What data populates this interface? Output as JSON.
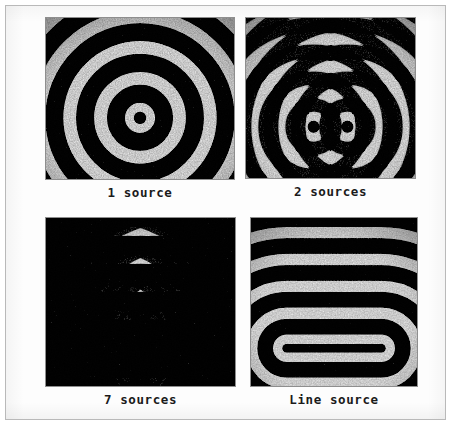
{
  "figure": {
    "kind": "ripple-tank-wave-pattern-figure",
    "background_color": "#ffffff",
    "frame_color": "#b9b9b9",
    "wave_crest_color": "#f2f2f2",
    "wave_trough_color": "#080808",
    "caption_color": "#1b1b1b",
    "panels": [
      {
        "id": "1-source",
        "caption": "1 source",
        "pattern": "concentric-circles",
        "source_count": 1,
        "sources": [
          {
            "x": 0.5,
            "y": 0.62
          }
        ],
        "wavelength": 0.082,
        "description": "Circular wavefronts radiating from a single point source"
      },
      {
        "id": "2-sources",
        "caption": "2 sources",
        "pattern": "two-point-interference",
        "source_count": 2,
        "sources": [
          {
            "x": 0.4,
            "y": 0.68
          },
          {
            "x": 0.6,
            "y": 0.68
          }
        ],
        "wavelength": 0.08,
        "description": "Two point sources producing interference nodal lines"
      },
      {
        "id": "7-sources",
        "caption": "7 sources",
        "pattern": "multi-point-interference",
        "source_count": 7,
        "sources": [
          {
            "x": 0.29,
            "y": 0.78
          },
          {
            "x": 0.36,
            "y": 0.78
          },
          {
            "x": 0.43,
            "y": 0.78
          },
          {
            "x": 0.5,
            "y": 0.78
          },
          {
            "x": 0.57,
            "y": 0.78
          },
          {
            "x": 0.64,
            "y": 0.78
          },
          {
            "x": 0.71,
            "y": 0.78
          }
        ],
        "wavelength": 0.074,
        "description": "Seven in-line point sources producing a nearly plane wavefront"
      },
      {
        "id": "line-source",
        "caption": "Line source",
        "pattern": "line-source-wavefronts",
        "source_count": 1,
        "source_segment": {
          "x1": 0.215,
          "x2": 0.785,
          "y": 0.775
        },
        "wavelength": 0.08,
        "description": "A continuous line source producing stadium-shaped wavefronts"
      }
    ]
  }
}
